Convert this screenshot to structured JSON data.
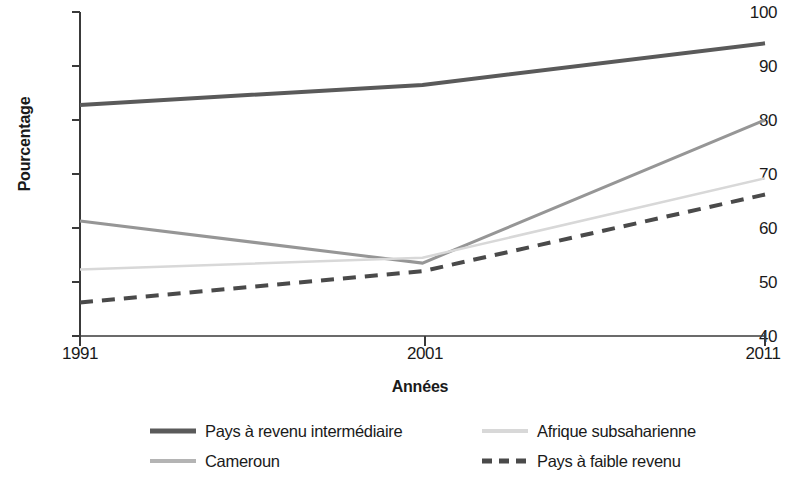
{
  "chart_data": {
    "type": "line",
    "title": "",
    "xlabel": "Années",
    "ylabel": "Pourcentage",
    "x": [
      1991,
      2001,
      2011
    ],
    "xtick_labels": [
      "1991",
      "2001",
      "2011"
    ],
    "ytick_labels": [
      "40",
      "50",
      "60",
      "70",
      "80",
      "90",
      "100"
    ],
    "yticks": [
      40,
      50,
      60,
      70,
      80,
      90,
      100
    ],
    "ylim": [
      40,
      100
    ],
    "xlim": [
      1991,
      2011
    ],
    "grid": false,
    "legend_position": "bottom",
    "series": [
      {
        "name": "Pays à revenu intermédiaire",
        "values": [
          82.8,
          86.5,
          94.2
        ],
        "color": "#5a5a5a",
        "style": "solid",
        "width": 4
      },
      {
        "name": "Cameroun",
        "values": [
          61.3,
          53.5,
          80.0
        ],
        "color": "#969696",
        "style": "solid",
        "width": 3
      },
      {
        "name": "Afrique subsaharienne",
        "values": [
          52.3,
          54.5,
          69.2
        ],
        "color": "#d8d8d8",
        "style": "solid",
        "width": 2.5
      },
      {
        "name": "Pays à faible revenu",
        "values": [
          46.2,
          52.0,
          66.2
        ],
        "color": "#4a4a4a",
        "style": "dashed",
        "width": 4
      }
    ]
  },
  "axes": {
    "y_title": "Pourcentage",
    "x_title": "Années",
    "y_labels": [
      "100",
      "90",
      "80",
      "70",
      "60",
      "50",
      "40"
    ],
    "x_labels": [
      "1991",
      "2001",
      "2011"
    ],
    "axis_color": "#3a3a3a"
  },
  "legend": {
    "entries": [
      {
        "label": "Pays à revenu intermédiaire",
        "color": "#5a5a5a",
        "style": "solid"
      },
      {
        "label": "Afrique subsaharienne",
        "color": "#d8d8d8",
        "style": "solid"
      },
      {
        "label": "Cameroun",
        "color": "#969696",
        "style": "solid"
      },
      {
        "label": "Pays à faible revenu",
        "color": "#4a4a4a",
        "style": "dashed"
      }
    ]
  }
}
